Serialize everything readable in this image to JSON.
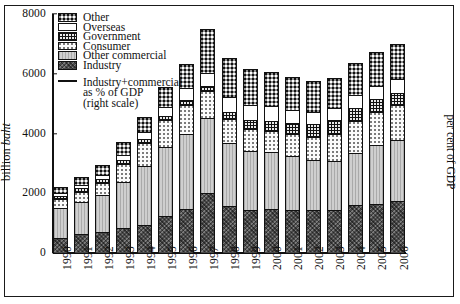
{
  "axes": {
    "ylabel_prefix": "billion ",
    "ylabel_italic": "baht",
    "right_label": "per cent of GDP",
    "yticks": [
      0,
      2000,
      4000,
      6000,
      8000
    ]
  },
  "legend": {
    "items": [
      {
        "label": "Other",
        "key": "other",
        "swatch": "f-other"
      },
      {
        "label": "Overseas",
        "key": "overseas",
        "swatch": "f-overseas"
      },
      {
        "label": "Government",
        "key": "government",
        "swatch": "f-government"
      },
      {
        "label": "Consumer",
        "key": "consumer",
        "swatch": "f-consumer"
      },
      {
        "label": "Other commercial",
        "key": "commercial",
        "swatch": "f-commercial"
      },
      {
        "label": "Industry",
        "key": "industry",
        "swatch": "f-industry"
      }
    ],
    "line_entry": {
      "line1": "Industry+commercial",
      "line2": "as % of GDP",
      "line3": "(right scale)"
    }
  },
  "chart_data": {
    "type": "bar",
    "stacked": true,
    "title": "",
    "xlabel": "",
    "ylabel": "billion baht",
    "y2label": "per cent of GDP",
    "ylim": [
      0,
      8000
    ],
    "yticks": [
      0,
      2000,
      4000,
      6000,
      8000
    ],
    "grid": false,
    "legend_position": "top-left",
    "categories": [
      "1990",
      "1991",
      "1992",
      "1993",
      "1994",
      "1995",
      "1996",
      "1997",
      "1998",
      "1999",
      "2000",
      "2001",
      "2002",
      "2003",
      "2004",
      "2005",
      "2006"
    ],
    "series": [
      {
        "name": "Industry",
        "values": [
          480,
          600,
          680,
          790,
          900,
          1190,
          1440,
          1960,
          1540,
          1420,
          1430,
          1420,
          1390,
          1400,
          1560,
          1620,
          1700
        ]
      },
      {
        "name": "Other commercial",
        "values": [
          1000,
          1090,
          1230,
          1570,
          1980,
          2310,
          2510,
          2520,
          2120,
          1950,
          1930,
          1800,
          1700,
          1660,
          1770,
          1960,
          2060
        ]
      },
      {
        "name": "Consumer",
        "values": [
          290,
          330,
          410,
          590,
          760,
          910,
          980,
          900,
          790,
          740,
          700,
          720,
          760,
          900,
          1040,
          1100,
          1150
        ]
      },
      {
        "name": "Government",
        "values": [
          95,
          110,
          120,
          130,
          140,
          150,
          160,
          170,
          230,
          300,
          340,
          380,
          420,
          450,
          450,
          440,
          430
        ]
      },
      {
        "name": "Overseas",
        "values": [
          100,
          120,
          150,
          180,
          230,
          310,
          410,
          450,
          520,
          520,
          480,
          450,
          420,
          400,
          430,
          450,
          450
        ]
      },
      {
        "name": "Other",
        "values": [
          220,
          270,
          330,
          420,
          520,
          640,
          790,
          1470,
          1290,
          1210,
          1140,
          1100,
          1040,
          1020,
          1080,
          1130,
          1180
        ]
      }
    ],
    "totals": [
      2185,
      2520,
      2920,
      3680,
      4530,
      5510,
      6290,
      7470,
      6490,
      6140,
      6020,
      5870,
      5730,
      5830,
      6330,
      6700,
      6970
    ]
  }
}
